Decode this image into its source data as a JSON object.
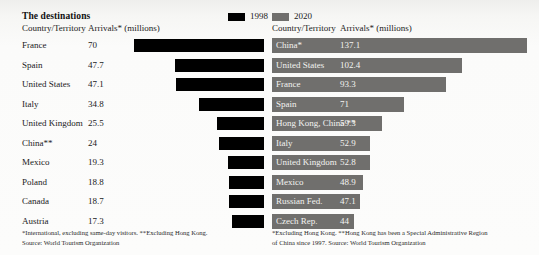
{
  "title": "The destinations",
  "legend": [
    {
      "label": "1998",
      "color": "#000000",
      "icon": "legend-swatch-icon"
    },
    {
      "label": "2020",
      "color": "#706f6d",
      "icon": "legend-swatch-icon"
    }
  ],
  "columns": {
    "country": "Country/Territory",
    "arrivals": "Arrivals* (millions)"
  },
  "notes": {
    "left_line1": "*International, excluding same-day visitors. **Excluding Hong Kong.",
    "left_line2": "Source: World Tourism Organization",
    "right_line1": "*Excluding Hong Kong. **Hong Kong has been a Special Administrative Region",
    "right_line2": "of China since 1997. Source: World Tourism Organization"
  },
  "chart_data": {
    "type": "bar",
    "title": "The destinations",
    "xlabel": "Arrivals* (millions)",
    "ylabel": "Country/Territory",
    "legend": [
      "1998",
      "2020"
    ],
    "legend_position": "top-center",
    "grid": false,
    "scale_px_per_unit": 1.86,
    "panels": [
      {
        "name": "1998",
        "series_color": "#000000",
        "bar_align": "right",
        "xlim": [
          0,
          70
        ],
        "categories": [
          "France",
          "Spain",
          "United States",
          "Italy",
          "United Kingdom",
          "China**",
          "Mexico",
          "Poland",
          "Canada",
          "Austria"
        ],
        "values": [
          70,
          47.7,
          47.1,
          34.8,
          25.5,
          24,
          19.3,
          18.8,
          18.7,
          17.3
        ],
        "value_labels": [
          "70",
          "47.7",
          "47.1",
          "34.8",
          "25.5",
          "24",
          "19.3",
          "18.8",
          "18.7",
          "17.3"
        ]
      },
      {
        "name": "2020",
        "series_color": "#706f6d",
        "bar_align": "left",
        "xlim": [
          0,
          137.1
        ],
        "categories": [
          "China*",
          "United States",
          "France",
          "Spain",
          "Hong Kong, China **",
          "Italy",
          "United Kingdom",
          "Mexico",
          "Russian Fed.",
          "Czech Rep."
        ],
        "values": [
          137.1,
          102.4,
          93.3,
          71,
          59.3,
          52.9,
          52.8,
          48.9,
          47.1,
          44
        ],
        "value_labels": [
          "137.1",
          "102.4",
          "93.3",
          "71",
          "59.3",
          "52.9",
          "52.8",
          "48.9",
          "47.1",
          "44"
        ]
      }
    ]
  }
}
